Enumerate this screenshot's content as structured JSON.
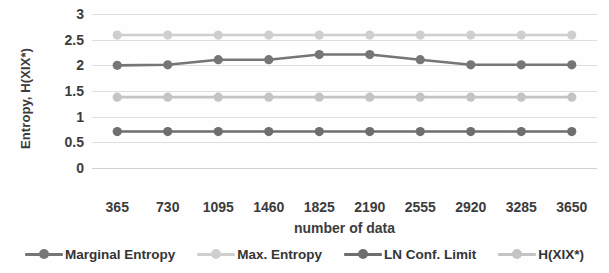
{
  "chart_data": {
    "type": "line",
    "title": "",
    "xlabel": "number of data",
    "ylabel": "Entropy, H(XIX*)",
    "x": [
      365,
      730,
      1095,
      1460,
      1825,
      2190,
      2555,
      2920,
      3285,
      3650
    ],
    "categories": [
      "365",
      "730",
      "1095",
      "1460",
      "1825",
      "2190",
      "2555",
      "2920",
      "3285",
      "3650"
    ],
    "ylim": [
      0,
      3
    ],
    "ytick_labels": [
      "0",
      "0.5",
      "1",
      "1.5",
      "2",
      "2.5",
      "3"
    ],
    "ytick_values": [
      0,
      0.5,
      1,
      1.5,
      2,
      2.5,
      3
    ],
    "grid": true,
    "legend_position": "bottom",
    "series": [
      {
        "name": "Marginal Entropy",
        "color": "#767676",
        "values": [
          2.0,
          2.01,
          2.11,
          2.11,
          2.21,
          2.21,
          2.11,
          2.01,
          2.01,
          2.01
        ]
      },
      {
        "name": "Max. Entropy",
        "color": "#cfcfcf",
        "values": [
          2.59,
          2.59,
          2.59,
          2.59,
          2.59,
          2.59,
          2.59,
          2.59,
          2.59,
          2.59
        ]
      },
      {
        "name": "LN Conf. Limit",
        "color": "#6e6e6e",
        "values": [
          0.71,
          0.71,
          0.71,
          0.71,
          0.71,
          0.71,
          0.71,
          0.71,
          0.71,
          0.71
        ]
      },
      {
        "name": "H(XIX*)",
        "color": "#c4c4c4",
        "values": [
          1.38,
          1.38,
          1.38,
          1.38,
          1.38,
          1.38,
          1.38,
          1.38,
          1.38,
          1.38
        ]
      }
    ]
  },
  "axes": {
    "y_title": "Entropy, H(XIX*)",
    "x_title": "number of data"
  },
  "colors": {
    "gridline": "#dedede",
    "text": "#3c3c3c",
    "background": "#fefefe"
  }
}
